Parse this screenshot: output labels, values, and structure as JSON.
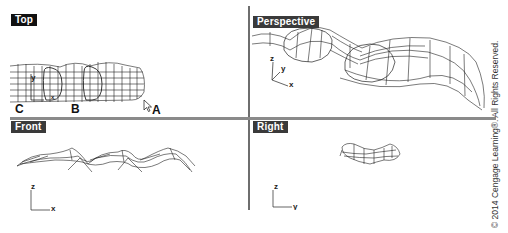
{
  "viewports": [
    {
      "id": "top",
      "label": "Top",
      "label_bg": "#111111"
    },
    {
      "id": "perspective",
      "label": "Perspective",
      "label_bg": "#3a3a3a"
    },
    {
      "id": "front",
      "label": "Front",
      "label_bg": "#3a3a3a"
    },
    {
      "id": "right",
      "label": "Right",
      "label_bg": "#3a3a3a"
    }
  ],
  "top_view": {
    "callouts": {
      "c": "C",
      "b": "B",
      "a": "A"
    },
    "axis": {
      "y": "y",
      "x": "x"
    },
    "cursor_icon": "arrow-cursor"
  },
  "perspective_view": {
    "axis": {
      "z": "z",
      "y": "y",
      "x": "x"
    }
  },
  "front_view": {
    "axis": {
      "z": "z",
      "x": "x"
    }
  },
  "right_view": {
    "axis": {
      "z": "z",
      "y": "y"
    }
  },
  "copyright": "© 2014 Cengage Learning®. All Rights Reserved."
}
